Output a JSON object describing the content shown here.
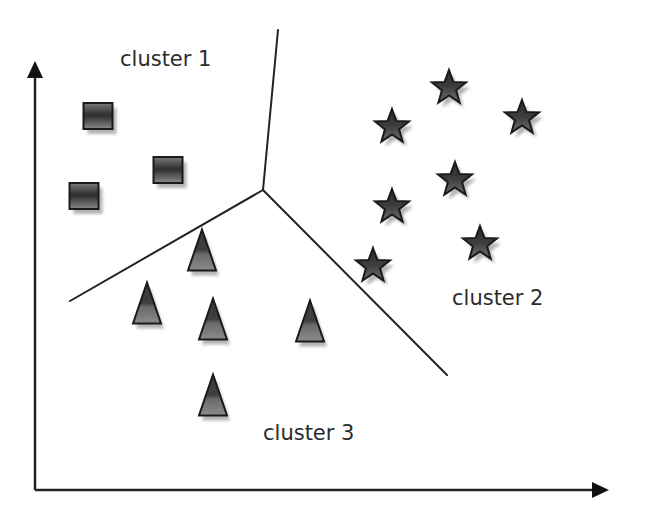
{
  "diagram": {
    "title": "",
    "type": "clustering-voronoi",
    "axes": {
      "x_axis": {
        "origin": [
          35,
          490
        ],
        "end": [
          608,
          490
        ],
        "label": ""
      },
      "y_axis": {
        "origin": [
          35,
          490
        ],
        "end": [
          35,
          61
        ],
        "label": ""
      }
    },
    "labels": {
      "cluster1": "cluster 1",
      "cluster2": "cluster 2",
      "cluster3": "cluster 3"
    },
    "label_positions": {
      "cluster1": [
        120,
        66
      ],
      "cluster2": [
        452,
        305
      ],
      "cluster3": [
        263,
        440
      ]
    },
    "boundaries": {
      "junction": [
        263,
        190
      ],
      "to_top": [
        278,
        30
      ],
      "to_left": [
        70,
        301
      ],
      "to_lower_right": [
        447,
        375
      ]
    },
    "clusters": [
      {
        "name": "cluster 1",
        "marker": "square",
        "points": [
          [
            98,
            116
          ],
          [
            168,
            170
          ],
          [
            84,
            196
          ]
        ]
      },
      {
        "name": "cluster 2",
        "marker": "star",
        "points": [
          [
            449,
            88
          ],
          [
            392,
            127
          ],
          [
            522,
            118
          ],
          [
            455,
            180
          ],
          [
            392,
            207
          ],
          [
            480,
            244
          ],
          [
            373,
            266
          ]
        ]
      },
      {
        "name": "cluster 3",
        "marker": "triangle",
        "points": [
          [
            202,
            250
          ],
          [
            147,
            303
          ],
          [
            213,
            319
          ],
          [
            310,
            321
          ],
          [
            213,
            395
          ]
        ]
      }
    ],
    "colors": {
      "background": "#ffffff",
      "line": "#222222",
      "marker_dark": "#2e2e2e",
      "marker_mid": "#6e6e6e",
      "shadow": "#9a9a9a",
      "text": "#2b2b2b"
    }
  }
}
